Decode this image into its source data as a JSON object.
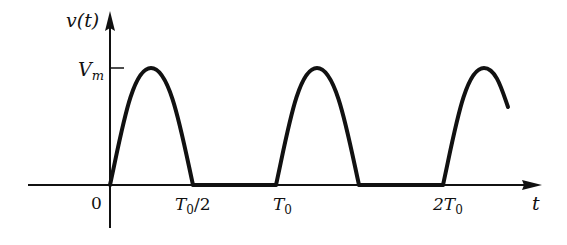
{
  "diagram": {
    "y_axis_label": "v(t)",
    "x_axis_label": "t",
    "amplitude_label": "V",
    "amplitude_sub": "m",
    "ticks": [
      {
        "id": "origin",
        "main": "0",
        "sub": "",
        "tail": ""
      },
      {
        "id": "half_period",
        "main": "T",
        "sub": "0",
        "tail": "/2"
      },
      {
        "id": "period",
        "main": "T",
        "sub": "0",
        "tail": ""
      },
      {
        "id": "two_period",
        "main": "2T",
        "sub": "0",
        "tail": ""
      }
    ],
    "colors": {
      "stroke": "#111111",
      "background": "#ffffff"
    }
  }
}
